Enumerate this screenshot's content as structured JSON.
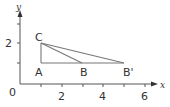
{
  "diagram": {
    "type": "coordinate-geometry",
    "axes": {
      "x_label": "x",
      "y_label": "y",
      "origin_label": "0",
      "x_ticks": [
        1,
        2,
        3,
        4,
        5,
        6
      ],
      "x_tick_labels": [
        "2",
        "4",
        "6"
      ],
      "y_ticks": [
        1,
        2,
        3
      ],
      "y_tick_labels": [
        "2"
      ]
    },
    "points": [
      {
        "name": "A",
        "x": 1,
        "y": 1
      },
      {
        "name": "B",
        "x": 3,
        "y": 1
      },
      {
        "name": "B'",
        "x": 5,
        "y": 1
      },
      {
        "name": "C",
        "x": 1,
        "y": 2
      }
    ],
    "segments": [
      [
        "A",
        "C"
      ],
      [
        "A",
        "B'"
      ],
      [
        "C",
        "B"
      ],
      [
        "C",
        "B'"
      ]
    ],
    "colors": {
      "axis": "#555555",
      "shape": "#777777",
      "text": "#333333"
    }
  }
}
